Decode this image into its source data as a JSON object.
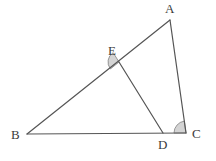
{
  "figure": {
    "type": "geometry-diagram",
    "background_color": "#ffffff",
    "stroke_color": "#555555",
    "stroke_width": 1.2,
    "angle_fill_color": "#d4d4d4",
    "angle_stroke_color": "#8c8c8c",
    "label_color": "#3b3b3b"
  },
  "points": {
    "A": {
      "label": "A",
      "x": 170,
      "y": 20,
      "label_x": 165,
      "label_y": 2
    },
    "B": {
      "label": "B",
      "x": 27,
      "y": 134,
      "label_x": 11,
      "label_y": 128
    },
    "C": {
      "label": "C",
      "x": 186,
      "y": 133,
      "label_x": 192,
      "label_y": 127
    },
    "D": {
      "label": "D",
      "x": 163,
      "y": 133,
      "label_x": 158,
      "label_y": 138
    },
    "E": {
      "label": "E",
      "x": 119,
      "y": 62,
      "label_x": 108,
      "label_y": 44
    }
  },
  "segments": [
    {
      "name": "segment-BA",
      "from": "B",
      "to": "A"
    },
    {
      "name": "segment-AC",
      "from": "A",
      "to": "C"
    },
    {
      "name": "segment-BC",
      "from": "B",
      "to": "C"
    },
    {
      "name": "segment-ED",
      "from": "E",
      "to": "D"
    }
  ],
  "angle_marks": [
    {
      "name": "angle-BED",
      "vertex": "E",
      "cx": 119,
      "cy": 62,
      "radius": 11,
      "start_deg": 141,
      "end_deg": 238,
      "filled": true
    },
    {
      "name": "angle-ACB",
      "vertex": "C",
      "cx": 186,
      "cy": 133,
      "radius": 12,
      "start_deg": 180,
      "end_deg": 262,
      "filled": true
    }
  ]
}
